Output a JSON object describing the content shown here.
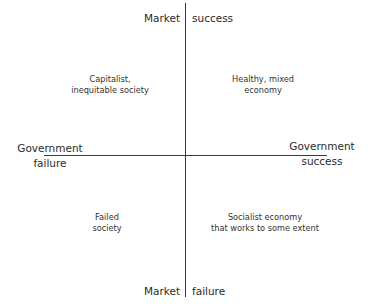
{
  "diagram": {
    "type": "quadrant",
    "axes": {
      "vertical": {
        "top": {
          "left": "Market",
          "right": "success"
        },
        "bottom": {
          "left": "Market",
          "right": "failure"
        }
      },
      "horizontal": {
        "left": {
          "line1": "Government",
          "line2": "failure"
        },
        "right": {
          "line1": "Government",
          "line2": "success"
        }
      }
    },
    "quadrants": {
      "top_left": {
        "line1": "Capitalist,",
        "line2": "inequitable society"
      },
      "top_right": {
        "line1": "Healthy, mixed",
        "line2": "economy"
      },
      "bottom_left": {
        "line1": "Failed",
        "line2": "society"
      },
      "bottom_right": {
        "line1": "Socialist economy",
        "line2": "that works to some extent"
      }
    },
    "colors": {
      "line": "#3a3a3a",
      "text": "#2a2a2a",
      "background": "#ffffff"
    }
  }
}
